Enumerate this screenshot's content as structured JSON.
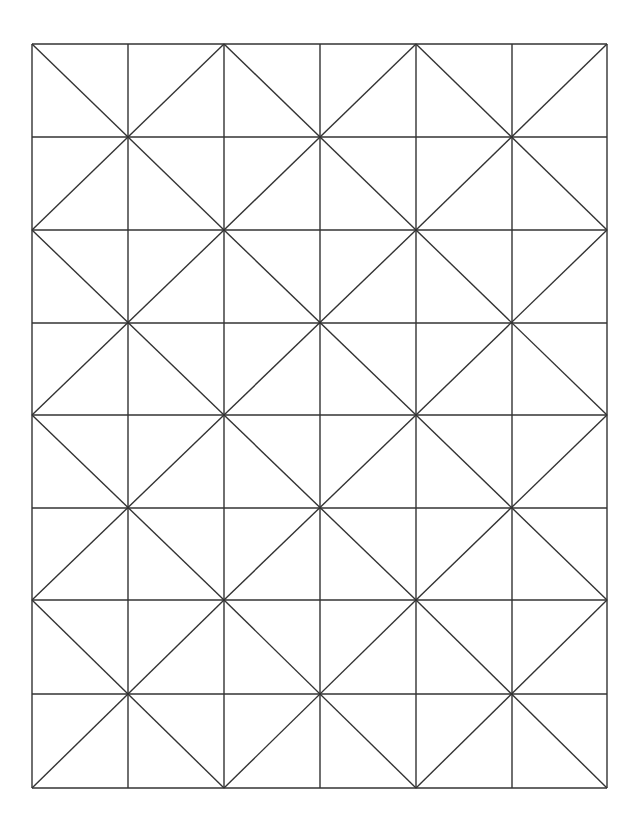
{
  "diagram": {
    "type": "grid-pattern",
    "stroke_color": "#333333",
    "background": "#ffffff",
    "x_lines": [
      32,
      128,
      224,
      320,
      416,
      512,
      607
    ],
    "y_lines": [
      44,
      137,
      230,
      323,
      415,
      508,
      600,
      694,
      788
    ],
    "columns": 6,
    "rows": 8
  }
}
